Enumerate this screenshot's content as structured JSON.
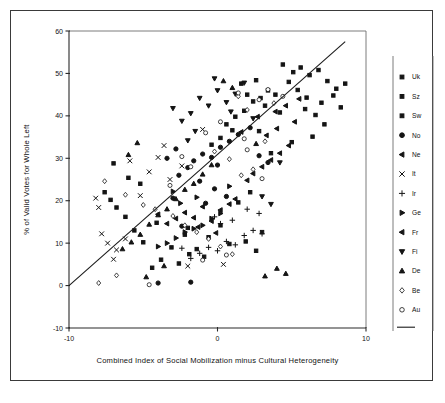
{
  "chart_data": {
    "type": "scatter",
    "title": "",
    "xlabel": "Combined Index of Social Mobilization minus Cultural Heterogeneity",
    "ylabel": "% of Valid Votes for Whole Left",
    "xlim": [
      -10,
      10
    ],
    "ylim": [
      -10,
      60
    ],
    "xticks": [
      -10,
      0,
      10
    ],
    "xtick_labels": [
      "-10",
      "0",
      "10"
    ],
    "yticks": [
      -10,
      0,
      10,
      20,
      30,
      40,
      50,
      60
    ],
    "ytick_labels": [
      "-10",
      "0",
      "10",
      "20",
      "30",
      "40",
      "50",
      "60"
    ],
    "grid": false,
    "legend_position": "right",
    "trendline": {
      "label": "regression-line",
      "x0": -10,
      "y0": 0,
      "x1": 8.6,
      "y1": 57.5
    },
    "legend": [
      {
        "label": "Uk",
        "marker": "small-square"
      },
      {
        "label": "Sz",
        "marker": "small-square"
      },
      {
        "label": "Sw",
        "marker": "small-square"
      },
      {
        "label": "No",
        "marker": "filled-circle"
      },
      {
        "label": "Ne",
        "marker": "left-triangle"
      },
      {
        "label": "It",
        "marker": "cross-x"
      },
      {
        "label": "Ir",
        "marker": "plus"
      },
      {
        "label": "Ge",
        "marker": "right-triangle"
      },
      {
        "label": "Fr",
        "marker": "left-triangle"
      },
      {
        "label": "Fi",
        "marker": "down-triangle"
      },
      {
        "label": "De",
        "marker": "up-triangle"
      },
      {
        "label": "Be",
        "marker": "open-diamond"
      },
      {
        "label": "Au",
        "marker": "open-circle"
      }
    ],
    "series": [
      {
        "name": "Uk",
        "marker": "small-square",
        "points": [
          [
            4.4,
            52.1
          ],
          [
            5.1,
            50.3
          ],
          [
            5.6,
            51.4
          ],
          [
            6.2,
            49.6
          ],
          [
            6.8,
            50.8
          ],
          [
            7.4,
            48.2
          ],
          [
            8.0,
            46.4
          ],
          [
            8.6,
            47.6
          ],
          [
            4.8,
            48.0
          ],
          [
            5.4,
            46.1
          ],
          [
            6.0,
            44.3
          ],
          [
            3.9,
            45.0
          ],
          [
            7.0,
            43.1
          ],
          [
            7.8,
            44.8
          ],
          [
            5.9,
            41.6
          ],
          [
            6.6,
            40.2
          ],
          [
            3.2,
            42.4
          ],
          [
            8.3,
            42.0
          ],
          [
            4.2,
            40.8
          ],
          [
            2.8,
            36.4
          ],
          [
            6.4,
            35.1
          ],
          [
            7.2,
            38.0
          ],
          [
            5.0,
            33.8
          ],
          [
            3.6,
            31.2
          ],
          [
            2.2,
            22.0
          ],
          [
            1.4,
            19.6
          ],
          [
            0.2,
            14.2
          ],
          [
            -0.6,
            11.4
          ],
          [
            0.8,
            9.8
          ],
          [
            1.9,
            10.4
          ],
          [
            2.6,
            8.2
          ],
          [
            -1.4,
            8.6
          ],
          [
            3.0,
            12.6
          ],
          [
            -2.2,
            12.0
          ]
        ]
      },
      {
        "name": "Sz",
        "marker": "small-square",
        "points": [
          [
            -3.8,
            6.1
          ],
          [
            -2.6,
            5.2
          ],
          [
            -1.9,
            7.4
          ],
          [
            -3.1,
            9.0
          ],
          [
            -4.4,
            4.2
          ],
          [
            -0.9,
            6.8
          ],
          [
            -5.0,
            10.2
          ],
          [
            -2.0,
            13.6
          ],
          [
            -4.1,
            14.8
          ],
          [
            -5.6,
            13.0
          ],
          [
            -6.2,
            16.2
          ],
          [
            -6.8,
            18.4
          ],
          [
            -7.2,
            20.2
          ],
          [
            -7.6,
            22.0
          ],
          [
            -6.0,
            25.4
          ],
          [
            -7.0,
            28.8
          ],
          [
            -5.2,
            24.0
          ]
        ]
      },
      {
        "name": "Sw",
        "marker": "small-square",
        "points": [
          [
            1.2,
            39.8
          ],
          [
            1.8,
            41.2
          ],
          [
            2.4,
            43.4
          ],
          [
            0.6,
            38.0
          ],
          [
            2.0,
            45.0
          ],
          [
            1.0,
            36.6
          ],
          [
            2.9,
            44.2
          ],
          [
            0.2,
            34.8
          ],
          [
            3.4,
            46.0
          ],
          [
            -0.4,
            33.2
          ],
          [
            1.6,
            47.6
          ],
          [
            2.6,
            48.4
          ]
        ]
      },
      {
        "name": "No",
        "marker": "filled-circle",
        "points": [
          [
            -1.6,
            29.4
          ],
          [
            -1.0,
            31.0
          ],
          [
            -0.4,
            30.2
          ],
          [
            0.2,
            32.6
          ],
          [
            0.8,
            34.0
          ],
          [
            -2.0,
            27.8
          ],
          [
            -2.6,
            26.0
          ],
          [
            0.0,
            28.4
          ],
          [
            1.4,
            35.6
          ],
          [
            -1.2,
            24.6
          ],
          [
            -0.2,
            22.8
          ],
          [
            0.6,
            21.0
          ],
          [
            -0.8,
            19.4
          ],
          [
            -3.0,
            20.6
          ],
          [
            2.2,
            37.2
          ],
          [
            -2.4,
            14.0
          ],
          [
            -4.0,
            0.6
          ],
          [
            -1.8,
            0.8
          ],
          [
            3.4,
            29.0
          ],
          [
            2.8,
            30.6
          ],
          [
            -3.4,
            30.0
          ],
          [
            -2.8,
            32.2
          ]
        ]
      },
      {
        "name": "Ne",
        "marker": "left-triangle",
        "points": [
          [
            -2.2,
            17.2
          ],
          [
            -1.6,
            16.0
          ],
          [
            -1.0,
            18.6
          ],
          [
            -0.4,
            15.2
          ],
          [
            -2.8,
            15.8
          ],
          [
            0.2,
            17.8
          ],
          [
            -3.4,
            14.6
          ],
          [
            0.8,
            19.2
          ],
          [
            -1.3,
            13.8
          ],
          [
            1.2,
            20.4
          ],
          [
            -0.1,
            12.4
          ],
          [
            -4.0,
            16.8
          ]
        ]
      },
      {
        "name": "It",
        "marker": "cross-x",
        "points": [
          [
            -8.0,
            18.4
          ],
          [
            -7.4,
            10.0
          ],
          [
            -7.8,
            12.2
          ],
          [
            -6.8,
            8.4
          ],
          [
            -5.9,
            29.4
          ],
          [
            -4.6,
            26.8
          ],
          [
            -5.2,
            21.2
          ],
          [
            -8.2,
            20.6
          ],
          [
            -3.2,
            25.0
          ],
          [
            -2.4,
            28.2
          ],
          [
            -4.0,
            30.2
          ],
          [
            -3.6,
            33.0
          ],
          [
            -1.0,
            36.8
          ],
          [
            -6.2,
            11.0
          ],
          [
            -7.0,
            6.2
          ],
          [
            -2.0,
            4.6
          ],
          [
            0.4,
            5.0
          ]
        ]
      },
      {
        "name": "Ir",
        "marker": "plus",
        "points": [
          [
            -0.6,
            9.0
          ],
          [
            0.0,
            8.2
          ],
          [
            0.6,
            10.4
          ],
          [
            1.2,
            9.6
          ],
          [
            -1.2,
            7.6
          ],
          [
            1.8,
            11.8
          ],
          [
            2.4,
            13.0
          ],
          [
            -1.8,
            6.4
          ],
          [
            3.0,
            12.2
          ],
          [
            0.2,
            14.6
          ],
          [
            -0.2,
            16.2
          ],
          [
            1.0,
            15.4
          ],
          [
            2.0,
            18.0
          ],
          [
            2.8,
            17.0
          ],
          [
            -2.4,
            8.8
          ]
        ]
      },
      {
        "name": "Ge",
        "marker": "right-triangle",
        "points": [
          [
            -2.8,
            11.2
          ],
          [
            -2.2,
            12.6
          ],
          [
            -1.6,
            13.4
          ],
          [
            -3.4,
            10.0
          ],
          [
            -1.0,
            14.2
          ],
          [
            -0.4,
            15.8
          ],
          [
            -4.0,
            9.2
          ],
          [
            0.2,
            17.0
          ],
          [
            -2.5,
            19.4
          ],
          [
            -1.4,
            20.8
          ],
          [
            -3.0,
            22.2
          ],
          [
            0.8,
            23.4
          ]
        ]
      },
      {
        "name": "Fr",
        "marker": "left-triangle",
        "points": [
          [
            3.0,
            28.0
          ],
          [
            3.6,
            29.6
          ],
          [
            4.2,
            31.2
          ],
          [
            2.4,
            26.4
          ],
          [
            4.8,
            33.0
          ],
          [
            3.3,
            35.4
          ],
          [
            4.0,
            37.0
          ],
          [
            2.0,
            24.8
          ],
          [
            5.2,
            38.6
          ],
          [
            2.7,
            39.8
          ],
          [
            3.9,
            41.0
          ],
          [
            4.6,
            42.4
          ],
          [
            5.5,
            44.0
          ],
          [
            1.6,
            36.2
          ]
        ]
      },
      {
        "name": "Fi",
        "marker": "down-triangle",
        "points": [
          [
            -1.2,
            44.2
          ],
          [
            -0.6,
            42.4
          ],
          [
            0.0,
            46.0
          ],
          [
            0.6,
            43.2
          ],
          [
            -1.8,
            40.6
          ],
          [
            1.2,
            45.2
          ],
          [
            -2.4,
            38.8
          ],
          [
            1.8,
            47.8
          ],
          [
            -0.2,
            48.8
          ],
          [
            0.9,
            41.0
          ],
          [
            -1.5,
            36.4
          ],
          [
            2.4,
            39.4
          ],
          [
            3.0,
            21.0
          ],
          [
            3.6,
            19.2
          ],
          [
            -3.0,
            41.8
          ],
          [
            4.2,
            29.0
          ],
          [
            -2.0,
            34.2
          ]
        ]
      },
      {
        "name": "De",
        "marker": "up-triangle",
        "points": [
          [
            -5.2,
            12.0
          ],
          [
            -4.6,
            14.4
          ],
          [
            -4.0,
            16.6
          ],
          [
            -5.8,
            10.2
          ],
          [
            -3.4,
            18.0
          ],
          [
            -2.8,
            20.4
          ],
          [
            -6.4,
            8.6
          ],
          [
            -2.2,
            22.6
          ],
          [
            -1.6,
            24.0
          ],
          [
            -1.0,
            26.2
          ],
          [
            0.4,
            48.2
          ],
          [
            1.0,
            46.6
          ],
          [
            -0.4,
            28.4
          ],
          [
            3.2,
            2.2
          ],
          [
            4.0,
            4.0
          ],
          [
            4.6,
            2.8
          ],
          [
            2.6,
            33.4
          ],
          [
            -4.8,
            2.0
          ],
          [
            -3.6,
            4.6
          ],
          [
            -6.0,
            30.8
          ],
          [
            -5.4,
            33.6
          ]
        ]
      },
      {
        "name": "Be",
        "marker": "open-diamond",
        "points": [
          [
            -7.6,
            24.6
          ],
          [
            -6.2,
            21.4
          ],
          [
            -5.0,
            19.0
          ],
          [
            -4.2,
            18.0
          ],
          [
            -3.0,
            16.4
          ],
          [
            -2.2,
            14.2
          ],
          [
            -1.4,
            12.6
          ],
          [
            -0.6,
            11.0
          ],
          [
            0.2,
            9.2
          ],
          [
            1.0,
            7.4
          ],
          [
            -8.0,
            0.6
          ],
          [
            -6.8,
            2.4
          ],
          [
            1.6,
            26.0
          ],
          [
            2.4,
            27.4
          ],
          [
            0.8,
            29.8
          ],
          [
            -0.2,
            31.6
          ],
          [
            3.2,
            34.0
          ],
          [
            2.0,
            41.4
          ],
          [
            3.8,
            43.0
          ],
          [
            1.4,
            44.6
          ]
        ]
      },
      {
        "name": "Au",
        "marker": "open-circle",
        "points": [
          [
            -4.6,
            0.2
          ],
          [
            -1.0,
            6.0
          ],
          [
            0.6,
            7.2
          ],
          [
            2.0,
            32.0
          ],
          [
            2.8,
            43.8
          ],
          [
            3.4,
            46.2
          ],
          [
            1.4,
            45.4
          ],
          [
            0.2,
            38.6
          ],
          [
            -0.8,
            36.0
          ],
          [
            1.8,
            34.6
          ],
          [
            -2.4,
            30.4
          ],
          [
            4.4,
            44.6
          ],
          [
            -1.8,
            28.0
          ],
          [
            3.0,
            25.2
          ],
          [
            -3.2,
            23.6
          ]
        ]
      }
    ]
  }
}
